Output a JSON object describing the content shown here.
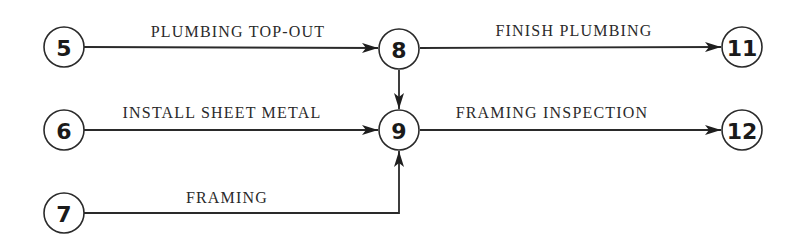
{
  "diagram": {
    "type": "activity-on-arrow network",
    "nodes": [
      {
        "id": "5",
        "label": "5",
        "x": 64,
        "y": 47
      },
      {
        "id": "6",
        "label": "6",
        "x": 64,
        "y": 130
      },
      {
        "id": "7",
        "label": "7",
        "x": 64,
        "y": 213
      },
      {
        "id": "8",
        "label": "8",
        "x": 399,
        "y": 49
      },
      {
        "id": "9",
        "label": "9",
        "x": 399,
        "y": 130
      },
      {
        "id": "11",
        "label": "11",
        "x": 742,
        "y": 47
      },
      {
        "id": "12",
        "label": "12",
        "x": 742,
        "y": 130
      }
    ],
    "edges": [
      {
        "from": "5",
        "to": "8",
        "label": "PLUMBING TOP-OUT"
      },
      {
        "from": "8",
        "to": "11",
        "label": "FINISH PLUMBING"
      },
      {
        "from": "8",
        "to": "9",
        "label": ""
      },
      {
        "from": "6",
        "to": "9",
        "label": "INSTALL SHEET METAL"
      },
      {
        "from": "9",
        "to": "12",
        "label": "FRAMING INSPECTION"
      },
      {
        "from": "7",
        "to": "9",
        "label": "FRAMING"
      }
    ]
  }
}
